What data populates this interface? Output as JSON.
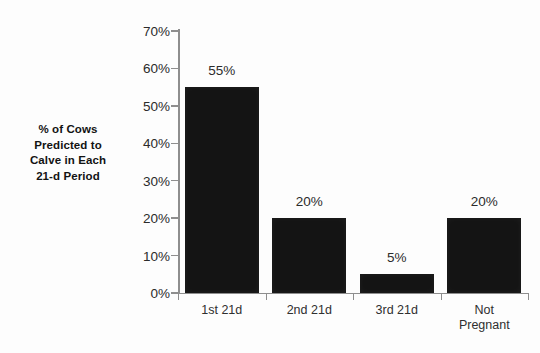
{
  "chart_data": {
    "type": "bar",
    "title": "",
    "subtitle": "",
    "xlabel": "",
    "ylabel": "% of Cows Predicted to Calve in Each 21-d Period",
    "ylabel_lines": [
      "% of Cows",
      "Predicted to",
      "Calve in Each",
      "21-d Period"
    ],
    "categories": [
      "1st 21d",
      "2nd 21d",
      "3rd 21d",
      "Not Pregnant"
    ],
    "category_label_lines": [
      [
        "1st 21d"
      ],
      [
        "2nd 21d"
      ],
      [
        "3rd 21d"
      ],
      [
        "Not",
        "Pregnant"
      ]
    ],
    "values": [
      55,
      20,
      5,
      20
    ],
    "data_labels": [
      "55%",
      "20%",
      "5%",
      "20%"
    ],
    "ylim": [
      0,
      70
    ],
    "ytick_values": [
      0,
      10,
      20,
      30,
      40,
      50,
      60,
      70
    ],
    "ytick_labels": [
      "0%",
      "10%",
      "20%",
      "30%",
      "40%",
      "50%",
      "60%",
      "70%"
    ],
    "grid": false,
    "legend": false,
    "legend_position": "none",
    "bar_color": "#141414",
    "axis_color": "#8e8e8e",
    "text_color": "#2b2b2b",
    "background_color": "#fdfdfd"
  }
}
